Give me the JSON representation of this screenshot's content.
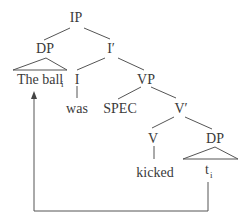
{
  "diagram": {
    "type": "syntax-tree",
    "nodes": {
      "ip": {
        "label": "IP"
      },
      "dp_subject": {
        "label": "DP"
      },
      "i_bar": {
        "label": "I′"
      },
      "the_ball": {
        "label": "The ball",
        "subscript": "i"
      },
      "i": {
        "label": "I"
      },
      "vp": {
        "label": "VP"
      },
      "was": {
        "label": "was"
      },
      "spec": {
        "label": "SPEC"
      },
      "v_bar": {
        "label": "V′"
      },
      "v": {
        "label": "V"
      },
      "dp_object": {
        "label": "DP"
      },
      "kicked": {
        "label": "kicked"
      },
      "trace": {
        "label": "t",
        "subscript": "i"
      }
    },
    "edges": [
      [
        "ip",
        "dp_subject"
      ],
      [
        "ip",
        "i_bar"
      ],
      [
        "i_bar",
        "i"
      ],
      [
        "i_bar",
        "vp"
      ],
      [
        "i",
        "was"
      ],
      [
        "vp",
        "spec"
      ],
      [
        "vp",
        "v_bar"
      ],
      [
        "v_bar",
        "v"
      ],
      [
        "v_bar",
        "dp_object"
      ],
      [
        "v",
        "kicked"
      ]
    ],
    "triangles": [
      [
        "dp_subject",
        "the_ball"
      ],
      [
        "dp_object",
        "trace"
      ]
    ],
    "movement": {
      "from": "trace",
      "to": "the_ball",
      "description": "movement arrow from trace t_i to The ball_i"
    }
  }
}
